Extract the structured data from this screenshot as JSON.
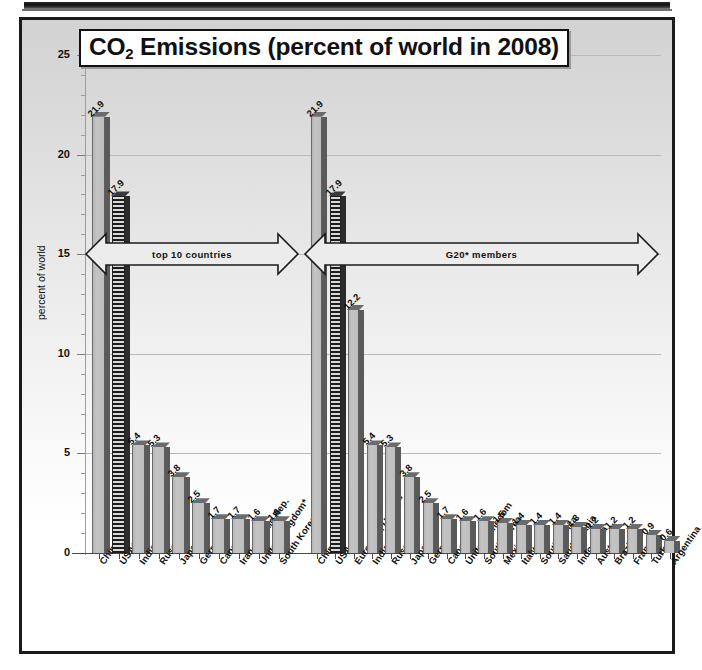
{
  "chart_data": {
    "type": "bar",
    "title": "CO2 Emissions (percent of world in 2008)",
    "title_main": "CO",
    "title_sub": "2",
    "title_rest": " Emissions (percent of world in 2008)",
    "xlabel": "",
    "ylabel": "percent of world",
    "ylim": [
      0,
      25
    ],
    "yticks": [
      0,
      5,
      10,
      15,
      20,
      25
    ],
    "ytick_labels": [
      "0",
      "5",
      "10",
      "15",
      "20",
      "25"
    ],
    "grid": true,
    "legend": "none",
    "groups": [
      {
        "name": "top 10 countries",
        "annotation": "top 10 countries",
        "categories": [
          "China*",
          "USA*",
          "India*",
          "Russia*",
          "Japan*",
          "Germany*",
          "Canada*",
          "Iran, Islamic Rep.",
          "United Kingdom*",
          "South Korea*"
        ],
        "values": [
          21.9,
          17.9,
          5.4,
          5.3,
          3.8,
          2.5,
          1.7,
          1.7,
          1.6,
          1.6
        ],
        "value_labels": [
          "21.9",
          "17.9",
          "5.4",
          "5.3",
          "3.8",
          "2.5",
          "1.7",
          "1.7",
          "1.6",
          "1.6"
        ],
        "highlighted_index": 1
      },
      {
        "name": "G20* members",
        "annotation": "G20* members",
        "categories": [
          "China",
          "USA",
          "European Union**",
          "India",
          "Russia",
          "Japan",
          "Germany",
          "Canada",
          "United Kingdom",
          "South Korea",
          "Mexico",
          "Italy",
          "South Africa",
          "Saudi Arabia",
          "Indonesia",
          "Australia",
          "Brazil",
          "France",
          "Turkey",
          "Argentina"
        ],
        "values": [
          21.9,
          17.9,
          12.2,
          5.4,
          5.3,
          3.8,
          2.5,
          1.7,
          1.6,
          1.6,
          1.5,
          1.4,
          1.4,
          1.4,
          1.3,
          1.2,
          1.2,
          1.2,
          0.9,
          0.6
        ],
        "value_labels": [
          "21.9",
          "17.9",
          "12.2",
          "5.4",
          "5.3",
          "3.8",
          "2.5",
          "1.7",
          "1.6",
          "1.6",
          "1.5",
          "1.4",
          "1.4",
          "1.4",
          "1.3",
          "1.2",
          "1.2",
          "1.2",
          "0.9",
          "0.6"
        ],
        "highlighted_index": 1
      }
    ],
    "colors": {
      "bar_face": "#bdbdbd",
      "bar_side": "#5a5a5a",
      "bar_highlight": "#1d1d1d",
      "axis": "#4a4a4a",
      "grid": "#b9b9b9",
      "text": "#111111",
      "frame": "#1b1b1b"
    }
  }
}
